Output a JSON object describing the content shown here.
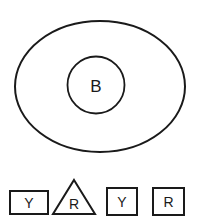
{
  "figure": {
    "background_color": "#ffffff",
    "stroke_color": "#1a1a1a",
    "fill_color": "#ffffff"
  },
  "main_group": {
    "name": "outer-ellipse-group",
    "outer_shape": {
      "kind": "ellipse",
      "label": "",
      "cx": 100,
      "cy": 86.5,
      "rx": 85,
      "ry": 65.5,
      "stroke_width": 2.0
    },
    "inner_shape": {
      "kind": "circle",
      "label": "B",
      "cx": 96,
      "cy": 85,
      "r": 28.5,
      "stroke_width": 1.8
    }
  },
  "shape_row": {
    "name": "bottom-shape-row",
    "items": [
      {
        "kind": "rectangle",
        "label": "Y",
        "x": 10,
        "y": 191,
        "width": 38,
        "height": 23,
        "stroke_width": 2.0,
        "label_x": 29,
        "label_y": 203
      },
      {
        "kind": "triangle",
        "label": "R",
        "apex_x": 74,
        "apex_y": 180,
        "left_x": 53,
        "right_x": 95,
        "base_y": 214,
        "stroke_width": 2.0,
        "label_x": 74,
        "label_y": 203
      },
      {
        "kind": "square",
        "label": "Y",
        "x": 107,
        "y": 188,
        "width": 30,
        "height": 27,
        "stroke_width": 2.0,
        "label_x": 122,
        "label_y": 202
      },
      {
        "kind": "square",
        "label": "R",
        "x": 153,
        "y": 188,
        "width": 31,
        "height": 27,
        "stroke_width": 2.0,
        "label_x": 168.5,
        "label_y": 202
      }
    ]
  }
}
